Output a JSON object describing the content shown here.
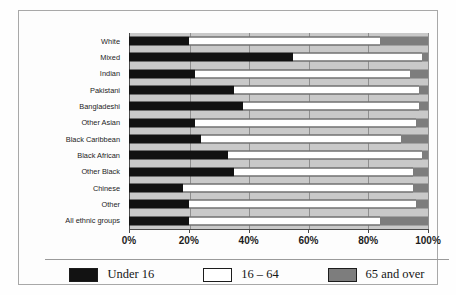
{
  "chart_data": {
    "type": "bar",
    "orientation": "horizontal",
    "stacked": true,
    "title": "",
    "xlabel": "",
    "ylabel": "",
    "xlim": [
      0,
      100
    ],
    "xticks": [
      "0%",
      "20%",
      "40%",
      "60%",
      "80%",
      "100%"
    ],
    "xtick_values": [
      0,
      20,
      40,
      60,
      80,
      100
    ],
    "grid": true,
    "legend_position": "bottom",
    "categories": [
      "White",
      "Mixed",
      "Indian",
      "Pakistani",
      "Bangladeshi",
      "Other Asian",
      "Black Caribbean",
      "Black African",
      "Other Black",
      "Chinese",
      "Other",
      "All ethnic groups"
    ],
    "series": [
      {
        "name": "Under 16",
        "color": "#121212",
        "values": [
          20,
          55,
          22,
          35,
          38,
          22,
          24,
          33,
          35,
          18,
          20,
          20
        ]
      },
      {
        "name": "16 – 64",
        "color": "#ffffff",
        "values": [
          64,
          43,
          72,
          62,
          59,
          74,
          67,
          65,
          60,
          77,
          76,
          64
        ]
      },
      {
        "name": "65 and over",
        "color": "#7d7d7d",
        "values": [
          16,
          2,
          6,
          3,
          3,
          4,
          9,
          2,
          5,
          5,
          4,
          16
        ]
      }
    ]
  },
  "legend": {
    "items": [
      {
        "label": "Under 16",
        "swatch": "under16"
      },
      {
        "label": "16 – 64",
        "swatch": "mid"
      },
      {
        "label": "65 and over",
        "swatch": "over65"
      }
    ]
  }
}
